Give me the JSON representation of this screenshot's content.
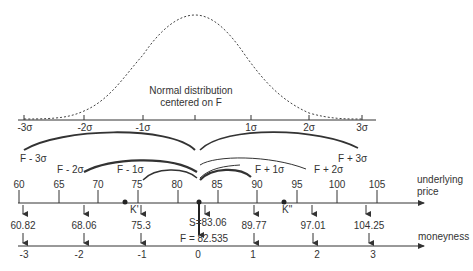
{
  "diagram": {
    "distribution_label_line1": "Normal distribution",
    "distribution_label_line2": "centered on F",
    "sigma_axis": {
      "ticks": [
        {
          "label": "-3σ",
          "x": 24
        },
        {
          "label": "-2σ",
          "x": 84
        },
        {
          "label": "-1σ",
          "x": 143
        },
        {
          "label": "",
          "x": 195
        },
        {
          "label": "1σ",
          "x": 251
        },
        {
          "label": "2σ",
          "x": 309
        },
        {
          "label": "3σ",
          "x": 362
        }
      ]
    },
    "arc_labels": {
      "f_minus_3": "F - 3σ",
      "f_minus_2": "F - 2σ",
      "f_minus_1": "F - 1σ",
      "f_plus_1": "F + 1σ",
      "f_plus_2": "F + 2σ",
      "f_plus_3": "F + 3σ"
    },
    "price_axis": {
      "title_line1": "underlying",
      "title_line2": "price",
      "ticks": [
        "60",
        "65",
        "70",
        "75",
        "80",
        "85",
        "90",
        "95",
        "100",
        "105"
      ],
      "strike_low": "K'",
      "strike_high": "K\"",
      "spot_label": "S=83.06",
      "forward_label": "F = 82.535"
    },
    "mapped_prices": [
      "60.82",
      "68.06",
      "75.3",
      "89.77",
      "97.01",
      "104.25"
    ],
    "moneyness_axis": {
      "title": "moneyness",
      "ticks": [
        "-3",
        "-2",
        "-1",
        "0",
        "1",
        "2",
        "3"
      ]
    }
  }
}
